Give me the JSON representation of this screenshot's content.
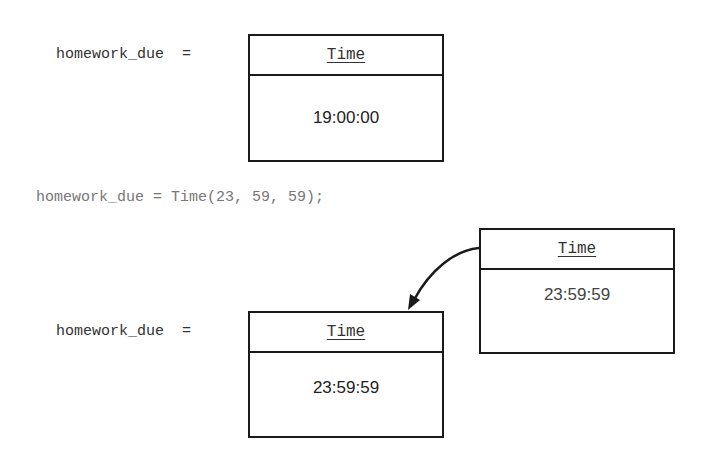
{
  "top": {
    "variable_label": "homework_due  =",
    "object": {
      "class_name": "Time",
      "value": "19:00:00"
    }
  },
  "statement": "homework_due = Time(23, 59, 59);",
  "bottom": {
    "variable_label": "homework_due  =",
    "object": {
      "class_name": "Time",
      "value": "23:59:59"
    }
  },
  "temp_object": {
    "class_name": "Time",
    "value": "23:59:59"
  }
}
